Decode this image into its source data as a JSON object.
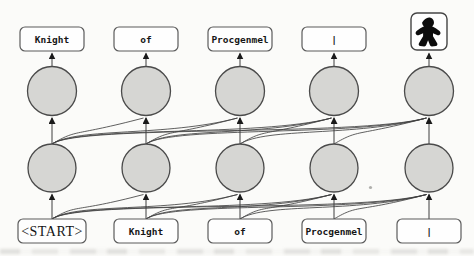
{
  "figure": {
    "type": "autoregressive-sequence-model-diagram",
    "inputs": [
      "<START>",
      "Knight",
      "of",
      "Procgenmel",
      "|"
    ],
    "outputs": [
      "Knight",
      "of",
      "Procgenmel",
      "|"
    ],
    "output_icon": "meeple-icon",
    "edges_rule": "causal: source position i connects to all target positions j >= i; arrows point upward",
    "colors": {
      "node_fill": "#d6d6d3",
      "node_stroke": "#4a4a4a",
      "box_fill": "#fefefe",
      "box_stroke": "#5b5b5b",
      "edge": "#3f3f3f",
      "arrowhead": "#1a1a1a",
      "meeple": "#0c0c0c",
      "background": "#fbfbf9"
    }
  }
}
